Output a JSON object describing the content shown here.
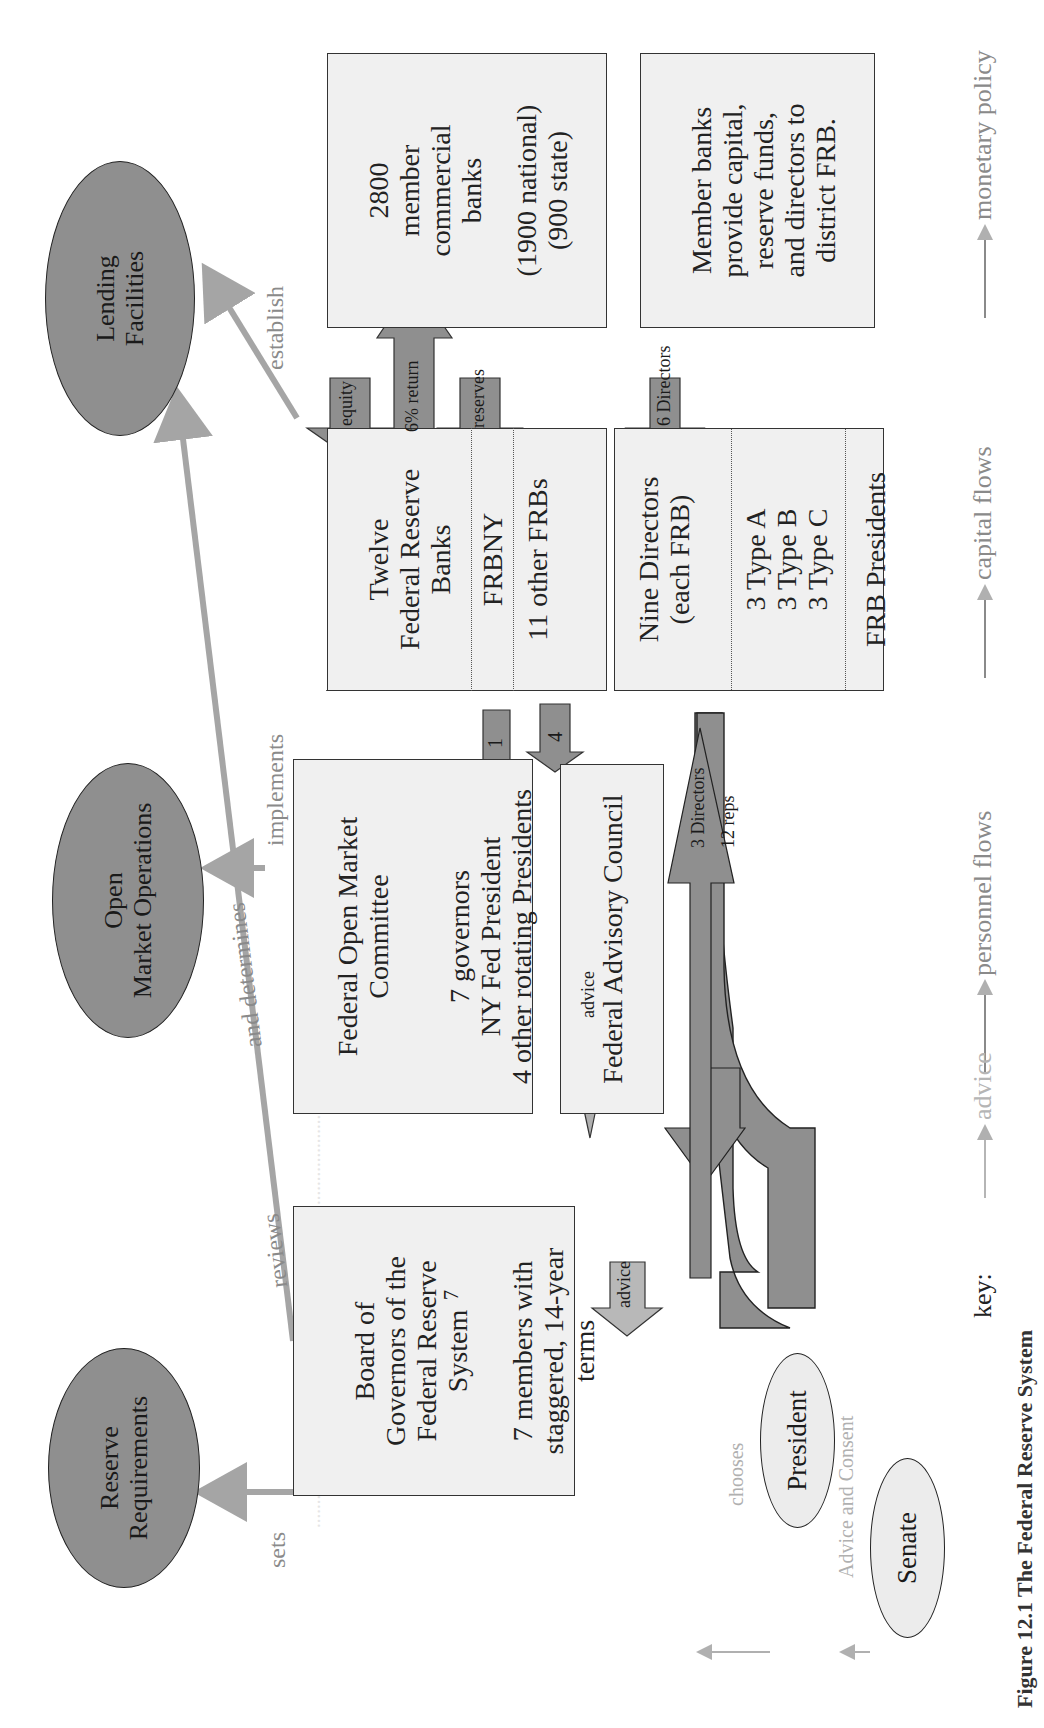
{
  "figure": {
    "caption": "Figure 12.1  The Federal Reserve System",
    "policy_tools": [
      {
        "label": "Reserve Requirements",
        "lines": [
          "Reserve",
          "Requirements"
        ]
      },
      {
        "label": "Open Market Operations",
        "lines": [
          "Open",
          "Market Operations"
        ]
      },
      {
        "label": "Lending Facilities",
        "lines": [
          "Lending",
          "Facilities"
        ]
      }
    ],
    "board": {
      "title_lines": [
        "Board of",
        "Governors of the",
        "Federal Reserve",
        "System"
      ],
      "detail_lines": [
        "7 members with",
        "staggered, 14-year",
        "terms"
      ]
    },
    "fomc": {
      "title_lines": [
        "Federal Open Market",
        "Committee"
      ],
      "detail_lines": [
        "7 governors",
        "NY Fed President",
        "4 other rotating Presidents"
      ]
    },
    "frbs": {
      "title_lines": [
        "Twelve",
        "Federal Reserve",
        "Banks"
      ],
      "frbny": "FRBNY",
      "others": "11 other FRBs"
    },
    "member_banks": {
      "title_lines": [
        "2800",
        "member",
        "commercial",
        "banks"
      ],
      "detail_lines": [
        "(1900 national)",
        "(900 state)"
      ]
    },
    "member_banks_note": {
      "lines": [
        "Member banks",
        "provide capital,",
        "reserve funds,",
        "and directors to",
        "district FRB."
      ]
    },
    "advisory_council": {
      "label": "Federal Advisory Council"
    },
    "directors": {
      "title_lines": [
        "Nine Directors",
        "(each FRB)"
      ],
      "types": [
        "3 Type A",
        "3 Type B",
        "3 Type C"
      ],
      "presidents": "FRB Presidents"
    },
    "president": {
      "label": "President"
    },
    "senate": {
      "label": "Senate"
    },
    "relation_labels": {
      "sets": "sets",
      "reviews": "reviews",
      "and_determines": "and determines",
      "implements": "implements",
      "establish": "establish",
      "chooses": "chooses",
      "advice_and_consent": "Advice and Consent"
    },
    "flow_arrows": {
      "board_to_fomc": "7",
      "frbny_to_fomc": "1",
      "frbs_to_fomc": "4",
      "advice_fac_to_board": "advice",
      "advice_fac_to_fomc": "advice",
      "equity": "equity",
      "return": "6% return",
      "reserves": "reserves",
      "six_directors": "6 Directors",
      "three_directors": "3 Directors",
      "twelve_reps": "12 reps"
    },
    "key": {
      "title": "key:",
      "items": [
        {
          "label": "advice",
          "color": "#b5b5b5"
        },
        {
          "label": "personnel flows",
          "color": "#8a8a8a"
        },
        {
          "label": "capital flows",
          "color": "#8a8a8a"
        },
        {
          "label": "monetary policy",
          "color": "#8a8a8a"
        }
      ]
    },
    "colors": {
      "dark_fill": "#8f8f8f",
      "box_fill": "#f0f0f0",
      "gray_arrow": "#a5a5a5",
      "advice_arrow": "#b5b5b5"
    }
  }
}
